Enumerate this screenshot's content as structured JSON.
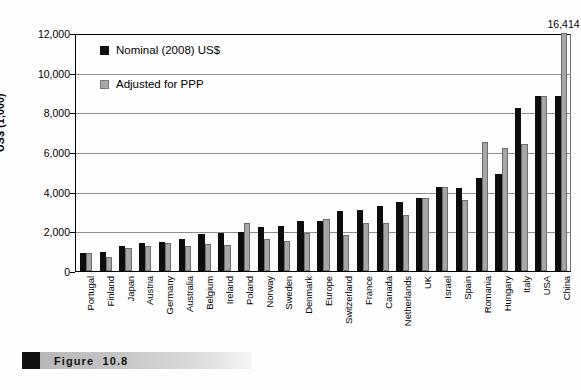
{
  "figure": {
    "caption_label": "Figure",
    "caption_number": "10.8"
  },
  "legend": {
    "position": "top-left-inside",
    "items": [
      {
        "name": "nominal",
        "label": "Nominal (2008) US$",
        "color": "#0d0d0d"
      },
      {
        "name": "ppp",
        "label": "Adjusted for PPP",
        "color": "#a6a6a6"
      }
    ]
  },
  "chart_data": {
    "type": "bar",
    "title": "",
    "subtitle": "",
    "xlabel": "",
    "ylabel": "US$ (1,000)",
    "ylim": [
      0,
      12000
    ],
    "yticks": [
      "0",
      "2,000",
      "4,000",
      "6,000",
      "8,000",
      "10,000",
      "12,000"
    ],
    "ytick_values": [
      0,
      2000,
      4000,
      6000,
      8000,
      10000,
      12000
    ],
    "grid": true,
    "grid_axis": "y",
    "legend_position": "inside top-left",
    "categories": [
      "Portugal",
      "Finland",
      "Japan",
      "Austria",
      "Germany",
      "Australia",
      "Belgium",
      "Ireland",
      "Poland",
      "Norway",
      "Sweden",
      "Denmark",
      "Europe",
      "Switzerland",
      "France",
      "Canada",
      "Netherlands",
      "UK",
      "Israel",
      "Spain",
      "Romania",
      "Hungary",
      "Italy",
      "USA",
      "China"
    ],
    "series": [
      {
        "name": "Nominal (2008) US$",
        "color": "#0d0d0d",
        "values": [
          900,
          950,
          1250,
          1400,
          1450,
          1600,
          1850,
          1900,
          1950,
          2200,
          2250,
          2500,
          2500,
          3050,
          3100,
          3300,
          3500,
          3700,
          4250,
          4200,
          4700,
          4900,
          8200,
          8800,
          8800
        ]
      },
      {
        "name": "Adjusted for PPP",
        "color": "#a6a6a6",
        "values": [
          900,
          700,
          1150,
          1250,
          1400,
          1250,
          1350,
          1300,
          2400,
          1600,
          1500,
          1900,
          2600,
          1800,
          2400,
          2400,
          2800,
          3700,
          4250,
          3600,
          6500,
          6200,
          6400,
          8800,
          16414
        ]
      }
    ],
    "annotations": [
      {
        "category": "China",
        "series": "Adjusted for PPP",
        "text": "16,414",
        "note": "bar clipped at axis maximum"
      }
    ]
  }
}
